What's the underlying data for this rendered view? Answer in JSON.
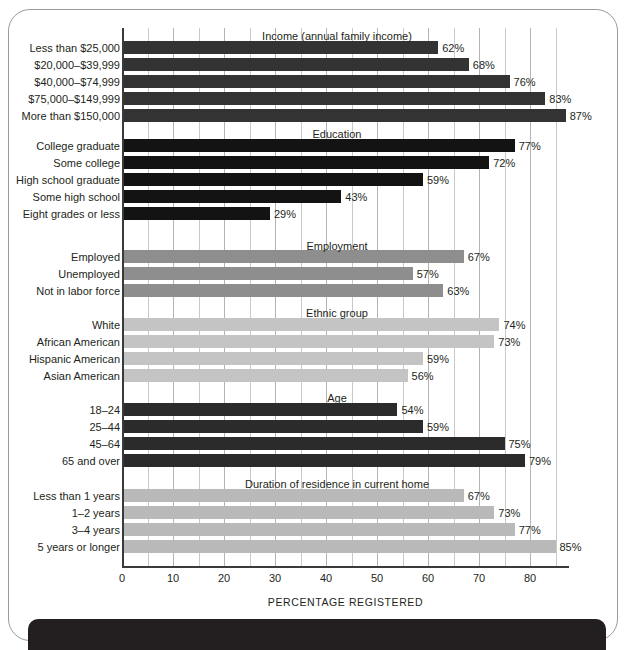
{
  "chart_data": {
    "type": "bar",
    "title": "",
    "orientation": "horizontal",
    "xlabel": "PERCENTAGE REGISTERED",
    "ylabel": "",
    "xlim": [
      0,
      87.45
    ],
    "grid": true,
    "legend": "none",
    "xticks": [
      "0",
      "10",
      "20",
      "30",
      "40",
      "50",
      "60",
      "70",
      "80"
    ],
    "xtick_values": [
      0,
      10,
      20,
      30,
      40,
      50,
      60,
      70,
      80
    ],
    "minor_tick_step": 5,
    "groups": [
      {
        "title": "Income (annual family income)",
        "color": "#333333",
        "categories": [
          "Less than $25,000",
          "$20,000–$39,999",
          "$40,000–$74,999",
          "$75,000–$149,999",
          "More than $150,000"
        ],
        "values": [
          62,
          68,
          76,
          83,
          87
        ],
        "labels": [
          "62%",
          "68%",
          "76%",
          "83%",
          "87%"
        ]
      },
      {
        "title": "Education",
        "color": "#131313",
        "categories": [
          "College graduate",
          "Some college",
          "High school graduate",
          "Some high school",
          "Eight grades or less"
        ],
        "values": [
          77,
          72,
          59,
          43,
          29
        ],
        "labels": [
          "77%",
          "72%",
          "59%",
          "43%",
          "29%"
        ]
      },
      {
        "title": "Employment",
        "color": "#8e8e8e",
        "categories": [
          "Employed",
          "Unemployed",
          "Not in labor force"
        ],
        "values": [
          67,
          57,
          63
        ],
        "labels": [
          "67%",
          "57%",
          "63%"
        ]
      },
      {
        "title": "Ethnic group",
        "color": "#c4c4c4",
        "categories": [
          "White",
          "African American",
          "Hispanic American",
          "Asian American"
        ],
        "values": [
          74,
          73,
          59,
          56
        ],
        "labels": [
          "74%",
          "73%",
          "59%",
          "56%"
        ]
      },
      {
        "title": "Age",
        "color": "#2b2b2b",
        "categories": [
          "18–24",
          "25–44",
          "45–64",
          "65 and over"
        ],
        "values": [
          54,
          59,
          75,
          79
        ],
        "labels": [
          "54%",
          "59%",
          "75%",
          "79%"
        ]
      },
      {
        "title": "Duration of residence in current home",
        "color": "#b9b9b9",
        "categories": [
          "Less than 1 years",
          "1–2 years",
          "3–4 years",
          "5 years or longer"
        ],
        "values": [
          67,
          73,
          77,
          85
        ],
        "labels": [
          "67%",
          "73%",
          "77%",
          "85%"
        ]
      }
    ]
  }
}
